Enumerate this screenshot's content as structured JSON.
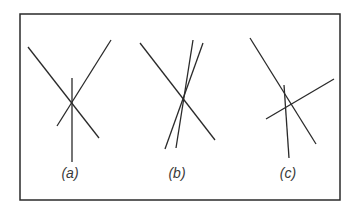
{
  "diagram": {
    "frame": {
      "x1": 20,
      "y1": 14,
      "x2": 340,
      "y2": 200,
      "stroke": "#2a2a2a"
    },
    "line_color": "#2a2a2a",
    "panels": [
      {
        "label": "(a)",
        "label_pos": [
          70,
          178
        ],
        "description": "three lines meeting at a single common point",
        "lines": [
          [
            28,
            47,
            99,
            138
          ],
          [
            57,
            126,
            111,
            40
          ],
          [
            72,
            78,
            72,
            162
          ]
        ]
      },
      {
        "label": "(b)",
        "label_pos": [
          177,
          178
        ],
        "description": "three lines nearly concurrent, two close lines crossing the diagonal",
        "lines": [
          [
            20,
            43,
            95,
            140
          ],
          [
            73,
            40,
            56,
            148
          ],
          [
            83,
            43,
            45,
            149
          ]
        ]
      },
      {
        "label": "(c)",
        "label_pos": [
          288,
          178
        ],
        "description": "three lines forming a small triangle, not concurrent",
        "lines": [
          [
            20,
            38,
            86,
            144
          ],
          [
            36,
            119,
            104,
            79
          ],
          [
            54,
            85,
            59,
            158
          ]
        ]
      }
    ]
  }
}
